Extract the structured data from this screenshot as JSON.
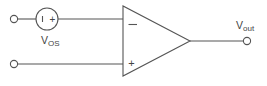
{
  "diagram": {
    "type": "op-amp circuit with input offset voltage source",
    "colors": {
      "line": "#555555",
      "text": "#444444",
      "background": "#ffffff"
    },
    "components": {
      "offset_source": {
        "label_main": "V",
        "label_sub": "OS",
        "polarity_left": "−",
        "polarity_right": "+"
      },
      "opamp": {
        "inverting_sign": "−",
        "noninverting_sign": "+"
      },
      "output": {
        "label_main": "V",
        "label_sub": "out"
      }
    },
    "terminals": [
      {
        "name": "input-top"
      },
      {
        "name": "input-bottom"
      },
      {
        "name": "output"
      }
    ]
  }
}
